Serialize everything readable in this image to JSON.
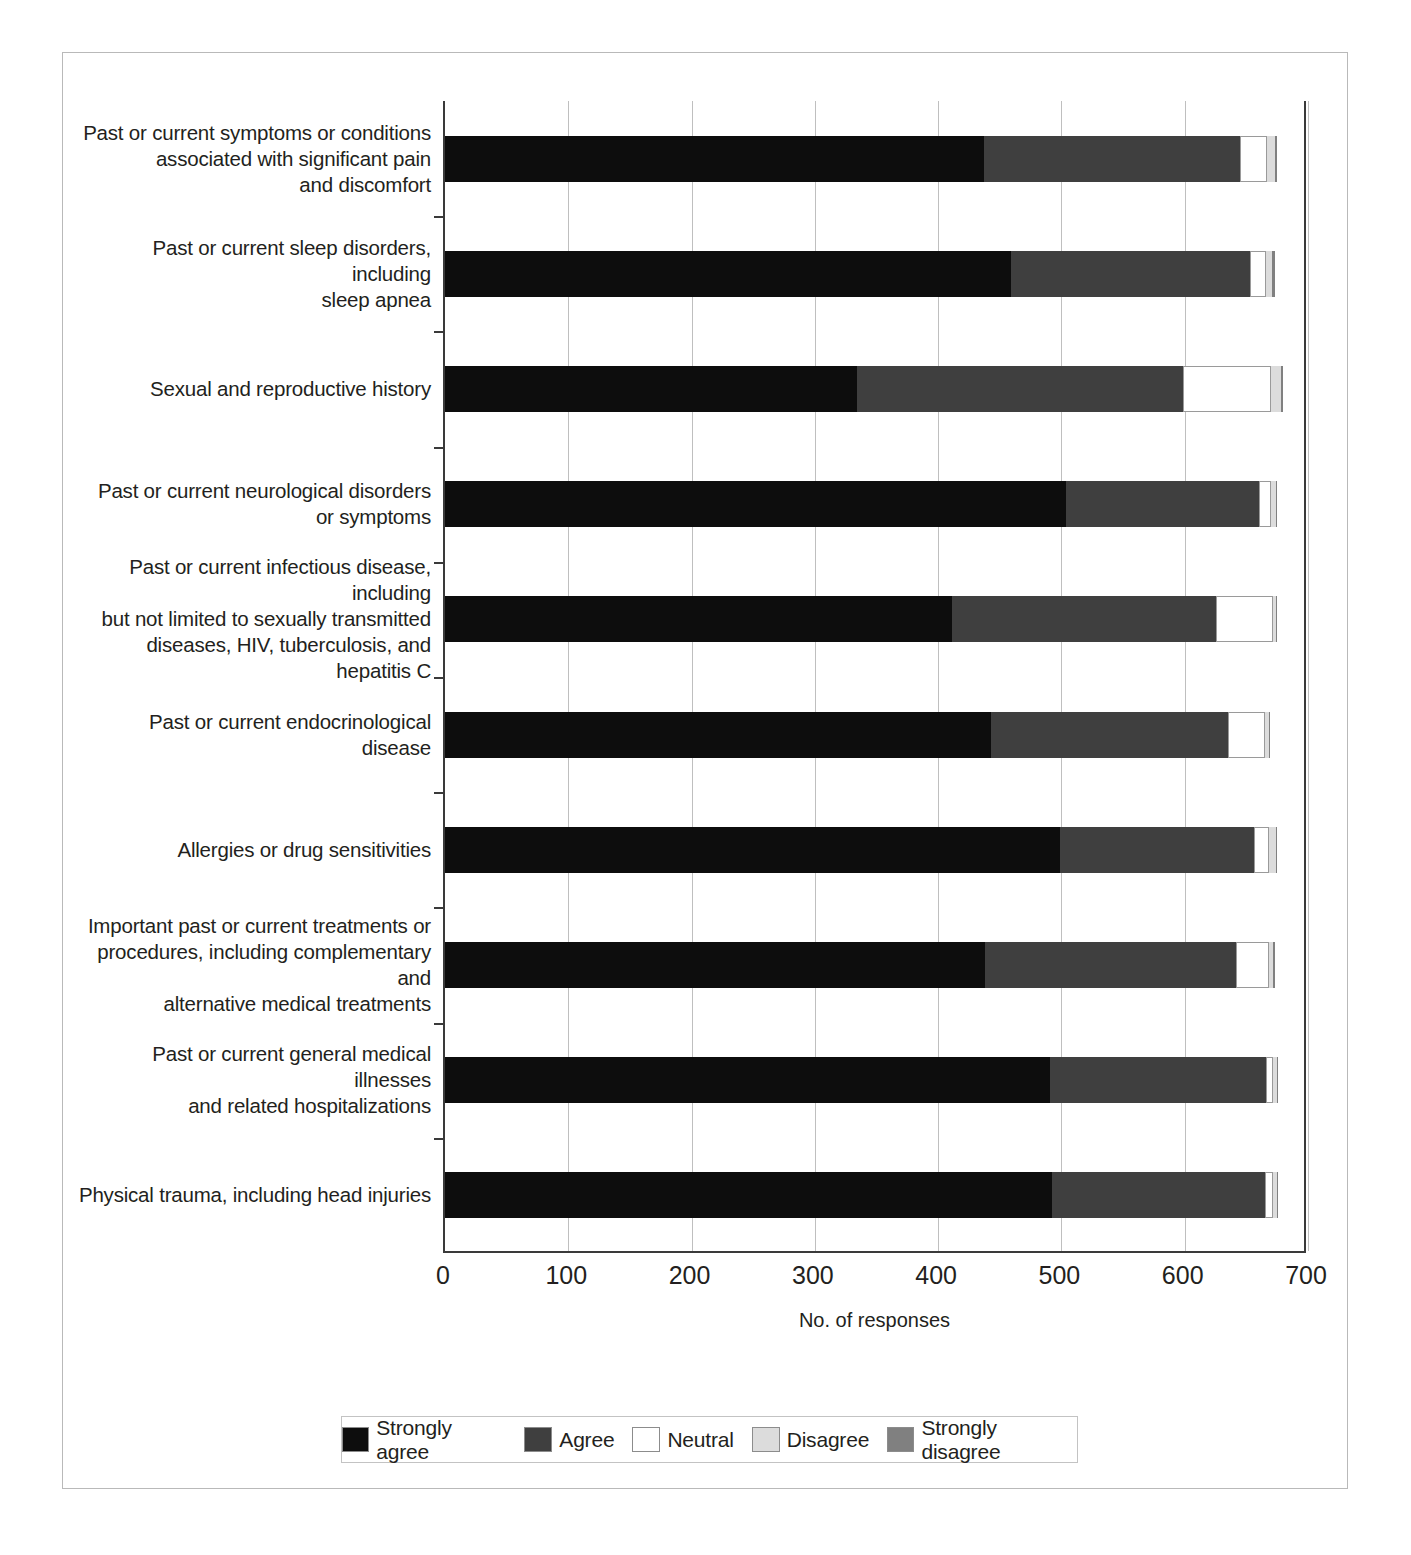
{
  "axis": {
    "xlabel": "No. of responses",
    "ticks": [
      "0",
      "100",
      "200",
      "300",
      "400",
      "500",
      "600",
      "700"
    ]
  },
  "legend": {
    "items": [
      {
        "label": "Strongly agree",
        "color": "#0d0d0d"
      },
      {
        "label": "Agree",
        "color": "#3f3f3f"
      },
      {
        "label": "Neutral",
        "color": "#ffffff"
      },
      {
        "label": "Disagree",
        "color": "#dcdcdc"
      },
      {
        "label": "Strongly disagree",
        "color": "#808080"
      }
    ]
  },
  "chart_data": {
    "type": "bar",
    "subtype": "stacked-horizontal",
    "title": "",
    "xlabel": "No. of responses",
    "ylabel": "",
    "xlim": [
      0,
      700
    ],
    "xticks": [
      0,
      100,
      200,
      300,
      400,
      500,
      600,
      700
    ],
    "grid": "vertical",
    "legend_position": "bottom",
    "categories": [
      "Past or current symptoms or conditions associated with significant pain and discomfort",
      "Past or current sleep disorders, including sleep apnea",
      "Sexual and reproductive history",
      "Past or current neurological disorders or symptoms",
      "Past or current infectious disease, including but not limited to sexually transmitted diseases, HIV, tuberculosis, and hepatitis C",
      "Past or current endocrinological disease",
      "Allergies or drug sensitivities",
      "Important past or current treatments or procedures, including complementary and alternative medical treatments",
      "Past or current general medical illnesses and related hospitalizations",
      "Physical trauma, including head injuries"
    ],
    "series": [
      {
        "name": "Strongly agree",
        "values": [
          437,
          459,
          334,
          504,
          411,
          443,
          499,
          438,
          491,
          492
        ]
      },
      {
        "name": "Agree",
        "values": [
          208,
          194,
          265,
          156,
          214,
          192,
          157,
          204,
          175,
          173
        ]
      },
      {
        "name": "Neutral",
        "values": [
          22,
          13,
          71,
          10,
          47,
          30,
          12,
          26,
          6,
          7
        ]
      },
      {
        "name": "Disagree",
        "values": [
          6,
          5,
          8,
          4,
          2,
          3,
          6,
          4,
          3,
          3
        ]
      },
      {
        "name": "Strongly disagree",
        "values": [
          2,
          2,
          2,
          1,
          1,
          1,
          1,
          1,
          1,
          1
        ]
      }
    ]
  },
  "rows": [
    {
      "label": "Past or current symptoms or conditions associated with significant pain and discomfort",
      "lines": [
        "Past or current symptoms or conditions",
        "associated with significant pain",
        "and discomfort"
      ]
    },
    {
      "label": "Past or current sleep disorders, including sleep apnea",
      "lines": [
        "Past or current sleep disorders, including",
        "sleep apnea"
      ]
    },
    {
      "label": "Sexual and reproductive history",
      "lines": [
        "Sexual and reproductive history"
      ]
    },
    {
      "label": "Past or current neurological disorders or symptoms",
      "lines": [
        "Past or current neurological disorders",
        "or symptoms"
      ]
    },
    {
      "label": "Past or current infectious disease, including but not limited to sexually transmitted diseases, HIV, tuberculosis, and hepatitis C",
      "lines": [
        "Past or current infectious disease, including",
        "but not limited to sexually transmitted",
        "diseases, HIV, tuberculosis, and hepatitis C"
      ]
    },
    {
      "label": "Past or current endocrinological disease",
      "lines": [
        "Past or current endocrinological disease"
      ]
    },
    {
      "label": "Allergies or drug sensitivities",
      "lines": [
        "Allergies or drug sensitivities"
      ]
    },
    {
      "label": "Important past or current treatments or procedures, including complementary and alternative medical treatments",
      "lines": [
        "Important past or current treatments or",
        "procedures, including complementary and",
        "alternative medical treatments"
      ]
    },
    {
      "label": "Past or current general medical illnesses and related hospitalizations",
      "lines": [
        "Past or current general medical illnesses",
        "and related hospitalizations"
      ]
    },
    {
      "label": "Physical trauma, including head injuries",
      "lines": [
        "Physical trauma, including head injuries"
      ]
    }
  ]
}
